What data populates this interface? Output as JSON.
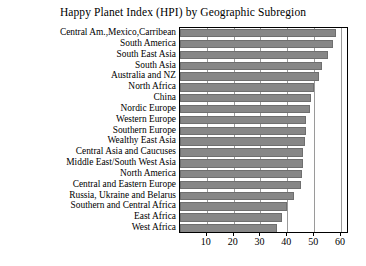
{
  "chart_data": {
    "type": "bar",
    "orientation": "horizontal",
    "title": "Happy Planet Index (HPI) by Geographic Subregion",
    "xlabel": "",
    "ylabel": "",
    "xlim": [
      0,
      63
    ],
    "grid": true,
    "legend": null,
    "xticks": [
      10,
      20,
      30,
      40,
      50,
      60
    ],
    "bar_color": "#878787",
    "bar_edge_color": "#6f6f6f",
    "categories": [
      "Central Am.,Mexico,Carribean",
      "South America",
      "South East Asia",
      "South Asia",
      "Australia and NZ",
      "North Africa",
      "China",
      "Nordic Europe",
      "Western Europe",
      "Southern Europe",
      "Wealthy East Asia",
      "Central Asia and Caucuses",
      "Middle East/South West Asia",
      "North America",
      "Central and Eastern Europe",
      "Russia, Ukraine and Belarus",
      "Southern and Central Africa",
      "East Africa",
      "West Africa"
    ],
    "values": [
      58,
      57,
      55,
      53,
      52,
      50,
      49,
      48.5,
      47,
      47,
      46.5,
      46,
      46,
      45.5,
      45,
      42.5,
      40,
      38,
      36
    ]
  }
}
